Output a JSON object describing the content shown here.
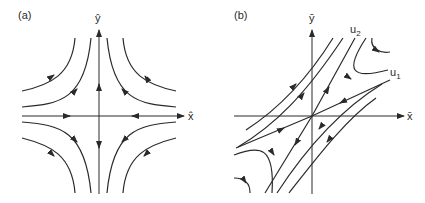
{
  "figure": {
    "panel_a": {
      "label": "(a)",
      "x_axis_label": "x̂",
      "y_axis_label": "ŷ",
      "description": "Saddle point phase portrait with hyperbolic trajectories; flow inward along x-axis, outward along y-axis"
    },
    "panel_b": {
      "label": "(b)",
      "x_axis_label": "x̄",
      "y_axis_label": "ȳ",
      "eigenvector_1_label": "u",
      "eigenvector_1_sub": "1",
      "eigenvector_2_label": "u",
      "eigenvector_2_sub": "2",
      "description": "Saddle point with skewed eigenvector directions u1 (stable) and u2 (unstable)"
    },
    "colors": {
      "ink": "#2a2a2a",
      "background": "#ffffff"
    }
  }
}
